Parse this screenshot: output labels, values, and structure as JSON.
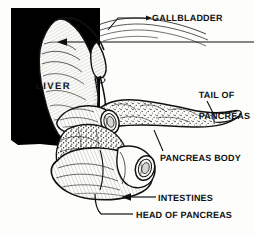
{
  "figure": {
    "kind": "anatomical-line-illustration",
    "style": "black-and-white pen-and-ink engraving with stippling and cross-hatching",
    "width": 254,
    "height": 235,
    "background_color": "#fdfdfb",
    "ink_color": "#111111",
    "black_panel_color": "#000000"
  },
  "labels": {
    "gallbladder": "GALLBLADDER",
    "liver": "LIVER",
    "tail_of_pancreas_line1": "TAIL OF",
    "tail_of_pancreas_line2": "PANCREAS",
    "pancreas_body": "PANCREAS BODY",
    "intestines": "INTESTINES",
    "head_of_pancreas": "HEAD OF PANCREAS"
  },
  "structures": [
    {
      "name": "liver",
      "label": "LIVER",
      "leader": "arrow pointing left into liver lobe"
    },
    {
      "name": "gallbladder",
      "label": "GALLBLADDER",
      "leader": "line with arrowhead to gallbladder neck"
    },
    {
      "name": "pancreas-tail",
      "label": "TAIL OF PANCREAS",
      "leader": "short line to tapered tail"
    },
    {
      "name": "pancreas-body",
      "label": "PANCREAS BODY",
      "leader": "short line to mid pancreas"
    },
    {
      "name": "intestines",
      "label": "INTESTINES",
      "leader": "horizontal line with arrowhead to duodenum loop"
    },
    {
      "name": "pancreas-head",
      "label": "HEAD OF PANCREAS",
      "leader": "horizontal line to stippled head region"
    }
  ]
}
